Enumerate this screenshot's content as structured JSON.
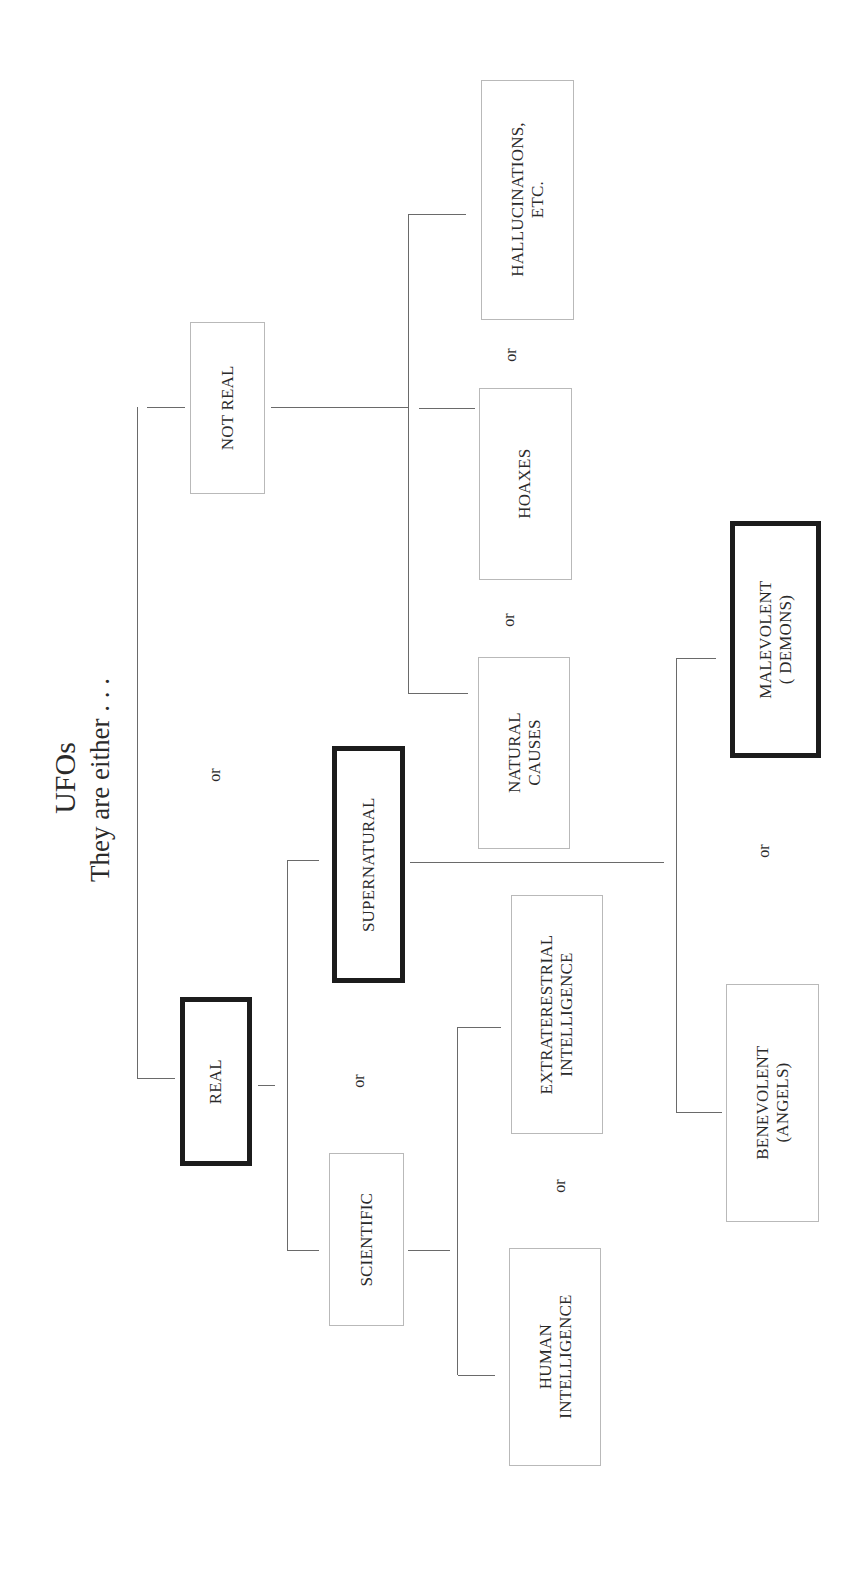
{
  "title": {
    "main": "UFOs",
    "subtitle": "They are either . . ."
  },
  "nodes": {
    "real": {
      "label": "REAL",
      "emphasis": "bold-border"
    },
    "not_real": {
      "label": "NOT REAL",
      "emphasis": "thin-border"
    },
    "supernatural": {
      "label": "SUPERNATURAL",
      "emphasis": "bold-border"
    },
    "scientific": {
      "label": "SCIENTIFIC",
      "emphasis": "thin-border"
    },
    "hallucinations": {
      "line1": "HALLUCINATIONS,",
      "line2": "ETC.",
      "emphasis": "thin-border"
    },
    "hoaxes": {
      "label": "HOAXES",
      "emphasis": "thin-border"
    },
    "natural_causes": {
      "line1": "NATURAL",
      "line2": "CAUSES",
      "emphasis": "thin-border"
    },
    "extraterrestrial": {
      "line1": "EXTRATERESTRIAL",
      "line2": "INTELLIGENCE",
      "emphasis": "thin-border"
    },
    "human": {
      "line1": "HUMAN",
      "line2": "INTELLIGENCE",
      "emphasis": "thin-border"
    },
    "malevolent": {
      "line1": "MALEVOLENT",
      "line2": "( DEMONS)",
      "emphasis": "bold-border"
    },
    "benevolent": {
      "line1": "BENEVOLENT",
      "line2": "(ANGELS)",
      "emphasis": "thin-border"
    }
  },
  "connectors": {
    "or_label": "or",
    "real_vs_not_real": "or",
    "supernatural_vs_scientific": "or",
    "hallucinations_vs_hoaxes": "or",
    "hoaxes_vs_natural": "or",
    "extraterrestrial_vs_human": "or",
    "malevolent_vs_benevolent": "or"
  },
  "colors": {
    "background": "#ffffff",
    "thin_border": "#b9b9b9",
    "bold_border": "#1c1c1c",
    "line": "#6a6a6a",
    "text": "#2a2a2a"
  }
}
